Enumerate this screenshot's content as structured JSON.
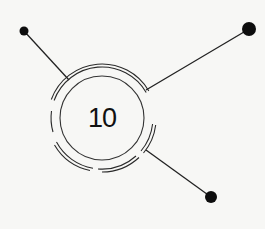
{
  "diagram": {
    "type": "hub-and-spoke",
    "center": {
      "label": "10",
      "x": 102,
      "y": 118
    },
    "nodes": [
      {
        "name": "node-top-left",
        "x": 24,
        "y": 31,
        "r": 4.5
      },
      {
        "name": "node-top-right",
        "x": 249,
        "y": 29,
        "r": 7
      },
      {
        "name": "node-bottom-right",
        "x": 211,
        "y": 197,
        "r": 6
      }
    ],
    "colors": {
      "background": "#f7f7f5",
      "stroke": "#222222",
      "text": "#111111"
    }
  }
}
